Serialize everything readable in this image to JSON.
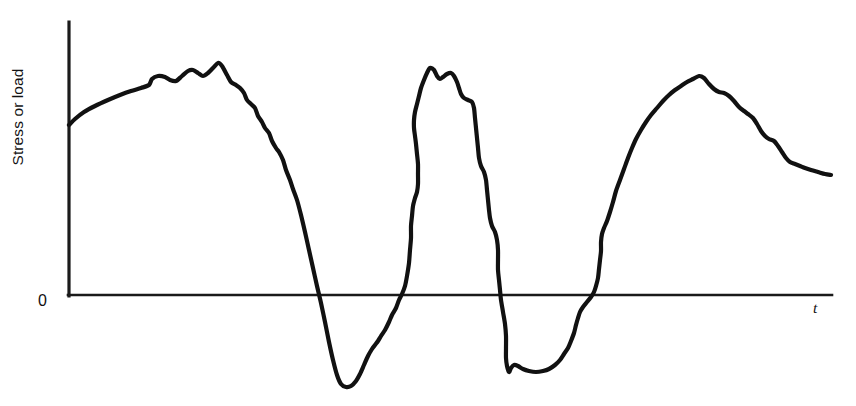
{
  "figure": {
    "background_color": "#ffffff",
    "line_color": "#111111",
    "axis_color": "#1a1a1a"
  },
  "labels": {
    "y_axis_label": "Stress or load",
    "origin_label": "0",
    "x_axis_label": "t"
  },
  "chart_data": {
    "type": "line",
    "title": "",
    "xlabel": "t",
    "ylabel": "Stress or load",
    "subtitle": "",
    "grid": false,
    "legend": "none",
    "annotations": [
      "0"
    ],
    "xlim": [
      0,
      856
    ],
    "ylim": [
      -110,
      285
    ],
    "axes_pixels": {
      "y_axis_x": 69,
      "y_axis_top_y": 22,
      "x_axis_y": 295,
      "x_axis_right_x": 832,
      "zero_level_y": 295
    },
    "series": [
      {
        "name": "stress-or-load",
        "points": [
          [
            69,
            125
          ],
          [
            75,
            119
          ],
          [
            84,
            112
          ],
          [
            95,
            106
          ],
          [
            108,
            100
          ],
          [
            120,
            95
          ],
          [
            131,
            91
          ],
          [
            141,
            88
          ],
          [
            149,
            85
          ],
          [
            152,
            79
          ],
          [
            158,
            76
          ],
          [
            165,
            77
          ],
          [
            170,
            80
          ],
          [
            176,
            81
          ],
          [
            182,
            76
          ],
          [
            188,
            71
          ],
          [
            193,
            70
          ],
          [
            198,
            73
          ],
          [
            203,
            76
          ],
          [
            208,
            73
          ],
          [
            213,
            68
          ],
          [
            218,
            63
          ],
          [
            222,
            66
          ],
          [
            227,
            75
          ],
          [
            231,
            82
          ],
          [
            236,
            85
          ],
          [
            240,
            88
          ],
          [
            244,
            93
          ],
          [
            247,
            100
          ],
          [
            251,
            104
          ],
          [
            255,
            108
          ],
          [
            258,
            116
          ],
          [
            262,
            122
          ],
          [
            265,
            128
          ],
          [
            269,
            133
          ],
          [
            272,
            141
          ],
          [
            276,
            148
          ],
          [
            279,
            152
          ],
          [
            283,
            160
          ],
          [
            286,
            170
          ],
          [
            290,
            180
          ],
          [
            293,
            189
          ],
          [
            297,
            200
          ],
          [
            301,
            215
          ],
          [
            305,
            232
          ],
          [
            309,
            250
          ],
          [
            313,
            268
          ],
          [
            317,
            286
          ],
          [
            321,
            303
          ],
          [
            325,
            322
          ],
          [
            329,
            342
          ],
          [
            333,
            360
          ],
          [
            337,
            375
          ],
          [
            341,
            384
          ],
          [
            346,
            387
          ],
          [
            351,
            386
          ],
          [
            356,
            381
          ],
          [
            360,
            374
          ],
          [
            364,
            365
          ],
          [
            368,
            356
          ],
          [
            372,
            349
          ],
          [
            375,
            345
          ],
          [
            378,
            341
          ],
          [
            381,
            336
          ],
          [
            385,
            330
          ],
          [
            389,
            322
          ],
          [
            392,
            315
          ],
          [
            396,
            308
          ],
          [
            399,
            300
          ],
          [
            402,
            294
          ],
          [
            405,
            286
          ],
          [
            407,
            276
          ],
          [
            409,
            263
          ],
          [
            410,
            250
          ],
          [
            411,
            238
          ],
          [
            411,
            226
          ],
          [
            412,
            216
          ],
          [
            413,
            206
          ],
          [
            415,
            198
          ],
          [
            417,
            192
          ],
          [
            418,
            184
          ],
          [
            418,
            174
          ],
          [
            418,
            164
          ],
          [
            417,
            154
          ],
          [
            416,
            144
          ],
          [
            415,
            136
          ],
          [
            414,
            128
          ],
          [
            414,
            120
          ],
          [
            415,
            112
          ],
          [
            417,
            104
          ],
          [
            419,
            96
          ],
          [
            421,
            88
          ],
          [
            424,
            80
          ],
          [
            427,
            73
          ],
          [
            430,
            68
          ],
          [
            434,
            70
          ],
          [
            437,
            76
          ],
          [
            440,
            79
          ],
          [
            443,
            77
          ],
          [
            447,
            74
          ],
          [
            451,
            73
          ],
          [
            454,
            76
          ],
          [
            457,
            82
          ],
          [
            459,
            88
          ],
          [
            461,
            94
          ],
          [
            464,
            98
          ],
          [
            468,
            100
          ],
          [
            472,
            102
          ],
          [
            474,
            108
          ],
          [
            475,
            118
          ],
          [
            476,
            128
          ],
          [
            477,
            138
          ],
          [
            478,
            148
          ],
          [
            479,
            158
          ],
          [
            481,
            166
          ],
          [
            484,
            172
          ],
          [
            486,
            180
          ],
          [
            487,
            190
          ],
          [
            488,
            200
          ],
          [
            489,
            210
          ],
          [
            490,
            218
          ],
          [
            492,
            226
          ],
          [
            495,
            232
          ],
          [
            497,
            240
          ],
          [
            498,
            250
          ],
          [
            498,
            260
          ],
          [
            498,
            270
          ],
          [
            499,
            280
          ],
          [
            500,
            290
          ],
          [
            501,
            300
          ],
          [
            503,
            312
          ],
          [
            505,
            324
          ],
          [
            506,
            336
          ],
          [
            506,
            348
          ],
          [
            506,
            358
          ],
          [
            507,
            366
          ],
          [
            509,
            372
          ],
          [
            511,
            368
          ],
          [
            514,
            365
          ],
          [
            518,
            366
          ],
          [
            523,
            369
          ],
          [
            529,
            371
          ],
          [
            536,
            372
          ],
          [
            543,
            371
          ],
          [
            549,
            369
          ],
          [
            555,
            365
          ],
          [
            560,
            360
          ],
          [
            564,
            354
          ],
          [
            568,
            348
          ],
          [
            571,
            341
          ],
          [
            574,
            333
          ],
          [
            576,
            325
          ],
          [
            578,
            318
          ],
          [
            580,
            312
          ],
          [
            583,
            307
          ],
          [
            587,
            302
          ],
          [
            591,
            297
          ],
          [
            594,
            292
          ],
          [
            596,
            286
          ],
          [
            598,
            278
          ],
          [
            599,
            269
          ],
          [
            600,
            260
          ],
          [
            601,
            251
          ],
          [
            601,
            242
          ],
          [
            602,
            234
          ],
          [
            604,
            228
          ],
          [
            607,
            221
          ],
          [
            610,
            212
          ],
          [
            613,
            202
          ],
          [
            616,
            191
          ],
          [
            620,
            180
          ],
          [
            624,
            169
          ],
          [
            628,
            158
          ],
          [
            632,
            148
          ],
          [
            636,
            139
          ],
          [
            641,
            130
          ],
          [
            646,
            122
          ],
          [
            651,
            115
          ],
          [
            657,
            108
          ],
          [
            663,
            101
          ],
          [
            669,
            95
          ],
          [
            675,
            90
          ],
          [
            681,
            86
          ],
          [
            687,
            82
          ],
          [
            693,
            79
          ],
          [
            699,
            76
          ],
          [
            704,
            78
          ],
          [
            709,
            84
          ],
          [
            714,
            89
          ],
          [
            719,
            92
          ],
          [
            724,
            93
          ],
          [
            729,
            96
          ],
          [
            734,
            101
          ],
          [
            739,
            107
          ],
          [
            744,
            111
          ],
          [
            748,
            114
          ],
          [
            753,
            118
          ],
          [
            757,
            124
          ],
          [
            761,
            131
          ],
          [
            765,
            136
          ],
          [
            769,
            139
          ],
          [
            774,
            141
          ],
          [
            778,
            146
          ],
          [
            782,
            152
          ],
          [
            786,
            158
          ],
          [
            790,
            162
          ],
          [
            795,
            164
          ],
          [
            800,
            166
          ],
          [
            805,
            168
          ],
          [
            811,
            170
          ],
          [
            818,
            172
          ],
          [
            825,
            174
          ],
          [
            831,
            175
          ]
        ]
      }
    ]
  }
}
